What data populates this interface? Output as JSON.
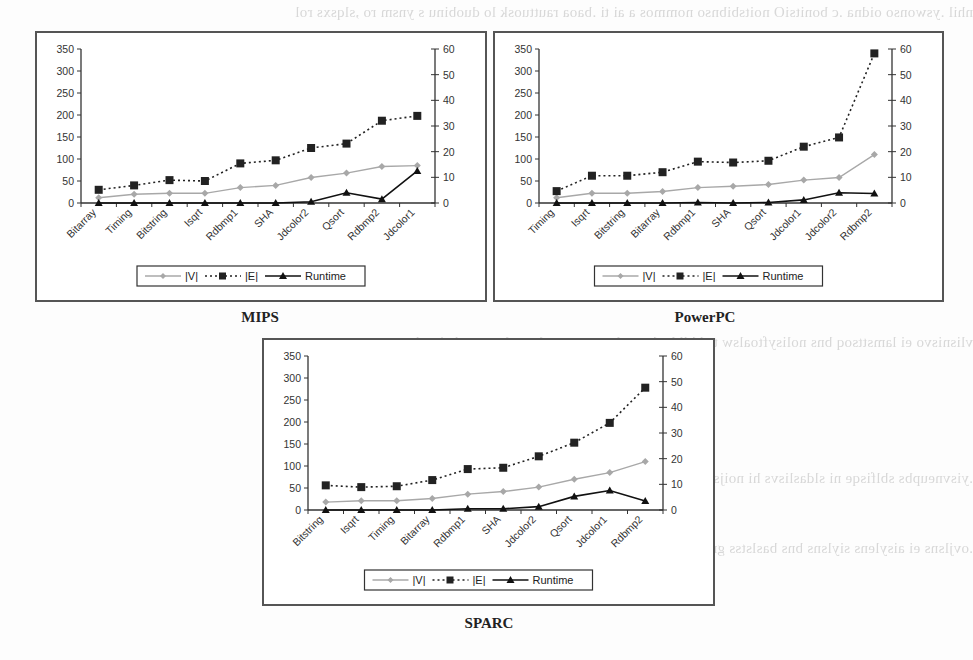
{
  "captions": {
    "mips": "MIPS",
    "powerpc": "PowerPC",
    "sparc": "SPARC"
  },
  "legend": {
    "v_label": "|V|",
    "e_label": "|E|",
    "runtime_label": "Runtime"
  },
  "colors": {
    "v_series": "#a8a8a8",
    "e_series": "#222222",
    "runtime_series": "#111111",
    "axis": "#333333",
    "frame": "#555555"
  },
  "chart_data": [
    {
      "type": "line",
      "title": "MIPS",
      "categories": [
        "Bitarray",
        "Timing",
        "Bitstring",
        "Isqrt",
        "Rdbmp1",
        "SHA",
        "Jdcolor2",
        "Qsort",
        "Rdbmp2",
        "Jdcolor1"
      ],
      "series": [
        {
          "name": "|V|",
          "axis": "left",
          "values": [
            12,
            20,
            22,
            22,
            35,
            40,
            58,
            68,
            83,
            85
          ]
        },
        {
          "name": "|E|",
          "axis": "left",
          "values": [
            30,
            40,
            52,
            50,
            90,
            97,
            125,
            135,
            187,
            198
          ]
        },
        {
          "name": "Runtime",
          "axis": "right",
          "values": [
            0,
            0,
            0,
            0,
            0,
            0,
            0.5,
            4,
            1.5,
            12.5
          ]
        }
      ],
      "ylim": [
        0,
        350
      ],
      "yticks": [
        0,
        50,
        100,
        150,
        200,
        250,
        300,
        350
      ],
      "y2lim": [
        0,
        60
      ],
      "y2ticks": [
        0,
        10,
        20,
        30,
        40,
        50,
        60
      ],
      "xlabel": "",
      "ylabel": "",
      "grid": false,
      "legend_position": "bottom"
    },
    {
      "type": "line",
      "title": "PowerPC",
      "categories": [
        "Timing",
        "Isqrt",
        "Bitstring",
        "Bitarray",
        "Rdbmp1",
        "SHA",
        "Qsort",
        "Jdcolor1",
        "Jdcolor2",
        "Rdbmp2"
      ],
      "series": [
        {
          "name": "|V|",
          "axis": "left",
          "values": [
            12,
            22,
            22,
            26,
            35,
            38,
            42,
            52,
            58,
            110
          ]
        },
        {
          "name": "|E|",
          "axis": "left",
          "values": [
            27,
            62,
            62,
            70,
            94,
            92,
            96,
            128,
            149,
            340
          ]
        },
        {
          "name": "Runtime",
          "axis": "right",
          "values": [
            0,
            0,
            0,
            0,
            0.2,
            0,
            0.2,
            1.2,
            4,
            3.7
          ]
        }
      ],
      "ylim": [
        0,
        350
      ],
      "yticks": [
        0,
        50,
        100,
        150,
        200,
        250,
        300,
        350
      ],
      "y2lim": [
        0,
        60
      ],
      "y2ticks": [
        0,
        10,
        20,
        30,
        40,
        50,
        60
      ],
      "xlabel": "",
      "ylabel": "",
      "grid": false,
      "legend_position": "bottom"
    },
    {
      "type": "line",
      "title": "SPARC",
      "categories": [
        "Bitstring",
        "Isqrt",
        "Timing",
        "Bitarray",
        "Rdbmp1",
        "SHA",
        "Jdcolor2",
        "Qsort",
        "Jdcolor1",
        "Rdbmp2"
      ],
      "series": [
        {
          "name": "|V|",
          "axis": "left",
          "values": [
            18,
            21,
            21,
            26,
            36,
            42,
            52,
            70,
            85,
            110
          ]
        },
        {
          "name": "|E|",
          "axis": "left",
          "values": [
            56,
            52,
            54,
            68,
            93,
            96,
            122,
            153,
            198,
            278
          ]
        },
        {
          "name": "Runtime",
          "axis": "right",
          "values": [
            0,
            0,
            0,
            0,
            0.5,
            0.5,
            1.3,
            5.3,
            7.6,
            3.5
          ]
        }
      ],
      "ylim": [
        0,
        350
      ],
      "yticks": [
        0,
        50,
        100,
        150,
        200,
        250,
        300,
        350
      ],
      "y2lim": [
        0,
        60
      ],
      "y2ticks": [
        0,
        10,
        20,
        30,
        40,
        50,
        60
      ],
      "xlabel": "",
      "ylabel": "",
      "grid": false,
      "legend_position": "bottom"
    }
  ]
}
